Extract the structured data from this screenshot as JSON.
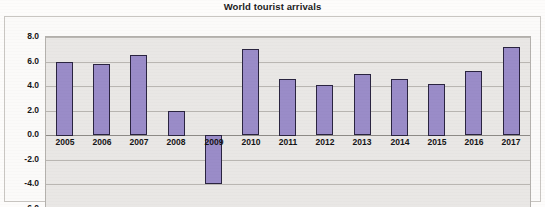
{
  "chart_data": {
    "type": "bar",
    "title": "World tourist arrivals",
    "xlabel": "",
    "ylabel": "",
    "categories": [
      "2005",
      "2006",
      "2007",
      "2008",
      "2009",
      "2010",
      "2011",
      "2012",
      "2013",
      "2014",
      "2015",
      "2016",
      "2017"
    ],
    "values": [
      6.0,
      5.8,
      6.5,
      2.0,
      -4.0,
      7.0,
      4.6,
      4.1,
      5.0,
      4.6,
      4.2,
      5.2,
      7.2
    ],
    "series": [
      {
        "name": "World tourist arrivals",
        "values": [
          6.0,
          5.8,
          6.5,
          2.0,
          -4.0,
          7.0,
          4.6,
          4.1,
          5.0,
          4.6,
          4.2,
          5.2,
          7.2
        ]
      }
    ],
    "ylim": [
      -6.0,
      8.0
    ],
    "ytick_values": [
      8.0,
      6.0,
      4.0,
      2.0,
      0.0,
      -2.0,
      -4.0,
      -6.0
    ],
    "ytick_labels": [
      "8.0",
      "6.0",
      "4.0",
      "2.0",
      "0.0",
      "-2.0",
      "-4.0",
      "-6.0"
    ],
    "grid": true,
    "legend": false,
    "legend_position": "none",
    "bar_color": "#9a8cc8",
    "bar_border_color": "#2a2440",
    "plot_background": "#e9e7e5",
    "gridline_color": "#b9b6b2"
  }
}
